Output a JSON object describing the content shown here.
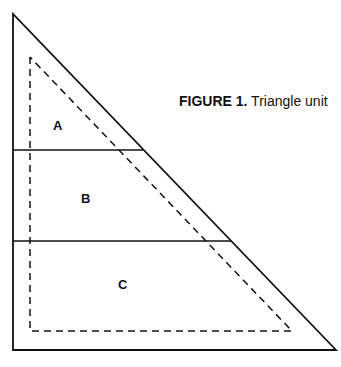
{
  "figure": {
    "caption_label": "FIGURE 1.",
    "caption_text": " Triangle unit"
  },
  "regions": [
    {
      "id": "A",
      "label": "A"
    },
    {
      "id": "B",
      "label": "B"
    },
    {
      "id": "C",
      "label": "C"
    }
  ],
  "colors": {
    "stroke": "#111111",
    "background": "#ffffff"
  }
}
